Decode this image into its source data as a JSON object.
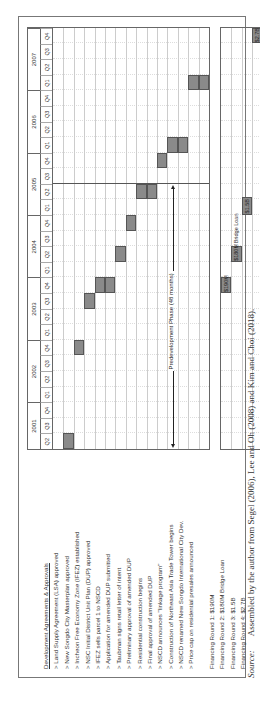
{
  "chart_data": {
    "type": "gantt",
    "title": "",
    "orientation": "rotated 90° counter-clockwise",
    "years": [
      {
        "year": "2001",
        "quarters": [
          "Q2",
          "Q3",
          "Q4"
        ]
      },
      {
        "year": "2002",
        "quarters": [
          "Q1",
          "Q2",
          "Q3",
          "Q4"
        ]
      },
      {
        "year": "2003",
        "quarters": [
          "Q1",
          "Q2",
          "Q3",
          "Q4"
        ]
      },
      {
        "year": "2004",
        "quarters": [
          "Q1",
          "Q2",
          "Q3",
          "Q4"
        ]
      },
      {
        "year": "2005",
        "quarters": [
          "Q1",
          "Q2",
          "Q3",
          "Q4"
        ]
      },
      {
        "year": "2006",
        "quarters": [
          "Q1",
          "Q2",
          "Q3",
          "Q4"
        ]
      },
      {
        "year": "2007",
        "quarters": [
          "Q1",
          "Q2",
          "Q3",
          "Q4"
        ]
      }
    ],
    "section_header": "Development Agreements & Approvals",
    "tasks": [
      {
        "label": "> Land Supply Agreement (LSA) approved",
        "start": "2001 Q2",
        "end": "2001 Q2"
      },
      {
        "label": "> New Songdo City Masterplan approved",
        "start": "2002 Q4",
        "end": "2002 Q4"
      },
      {
        "label": "> Incheon Free Economy Zone (IFEZ) established",
        "start": "2003 Q3",
        "end": "2003 Q3"
      },
      {
        "label": "> NSC Initial District Unit Plan (DUP) approved",
        "start": "2003 Q4",
        "end": "2003 Q4"
      },
      {
        "label": "> IFEZ sells parcel 1 to NSCD",
        "start": "2003 Q4",
        "end": "2003 Q4"
      },
      {
        "label": "> Application for amended DUP submitted",
        "start": "2004 Q2",
        "end": "2004 Q2"
      },
      {
        "label": "> Taubman signs retail letter of intent",
        "start": "2004 Q4",
        "end": "2004 Q4"
      },
      {
        "label": "> Preliminary approval of amended DUP",
        "start": "2005 Q2",
        "end": "2005 Q2"
      },
      {
        "label": "> Residential construction begins",
        "start": "2005 Q2",
        "end": "2005 Q2"
      },
      {
        "label": "> Final approval of amended DUP",
        "start": "2005 Q4",
        "end": "2005 Q4"
      },
      {
        "label": "> NSCD announces \"linkage program\"",
        "start": "2006 Q1",
        "end": "2006 Q1"
      },
      {
        "label": "> Construction of Northeast Asia Trade Tower begins",
        "start": "2006 Q1",
        "end": "2006 Q1"
      },
      {
        "label": "> NSCD renamed New Songdo International City Dev.",
        "start": "2007 Q1",
        "end": "2007 Q1"
      },
      {
        "label": "> Price cap on residential presales announced",
        "start": "2007 Q1",
        "end": "2007 Q1"
      }
    ],
    "phase_annotation": {
      "label": "Predevelopment Phase (48 months)",
      "start": "2001 Q2",
      "end": "2005 Q2"
    },
    "milestone_line": "2005 Q2",
    "financing": [
      {
        "label": "Financing Round 1: $190M",
        "bar_text": "$190M",
        "start": "2003 Q4",
        "end": "2003 Q4"
      },
      {
        "label": "Financing Round 2: $180M Bridge Loan",
        "bar_text": "$180M",
        "note": "Bridge Loan",
        "start": "2004 Q2",
        "end": "2004 Q2"
      },
      {
        "label": "Financing Round 3: $1.5B",
        "bar_text": "$1.5B",
        "start": "2005 Q1",
        "end": "2005 Q1"
      },
      {
        "label": "Financing Round 4: $2.7B",
        "bar_text": "$2.7B",
        "start": "2007 Q4",
        "end": "2007 Q4"
      }
    ]
  },
  "source": {
    "prefix": "Source:",
    "text": "Assembled by the author from Segel (2006), Lee and Oh (2008) and Kim and Choi (2018)."
  }
}
